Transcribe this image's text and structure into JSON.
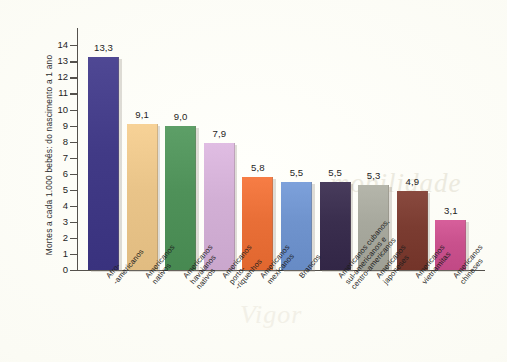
{
  "figure": {
    "background_color": "#fdfdf8",
    "watermark_text": "mobilidade",
    "watermark_text_2": "Vigor"
  },
  "chart_data": {
    "type": "bar",
    "title": "",
    "xlabel": "",
    "ylabel": "Mortes a cada 1.000 bebês: do nascimento a 1 ano",
    "ylim": [
      0,
      14
    ],
    "ytick_labels": [
      "0",
      "1",
      "2",
      "3",
      "4",
      "5",
      "6",
      "7",
      "8",
      "9",
      "10",
      "11",
      "12",
      "13",
      "14"
    ],
    "grid": false,
    "legend": "none",
    "value_label_format": "comma-decimal",
    "categories": [
      "Afro-\n-americanos",
      "Americanos\nnativos",
      "Americanos\nhavaianos\nnativos",
      "Americanos\nporto-\n-riquenhos",
      "Americanos\nmexicanos",
      "Brancos",
      "Americanos cubanos,\nsul-americanos e\ncentro-americanos",
      "Americanos\njaponeses",
      "Americanos\nvietnamitas",
      "Americanos\nchineses"
    ],
    "values": [
      13.3,
      9.1,
      9.0,
      7.9,
      5.8,
      5.5,
      5.5,
      5.3,
      4.9,
      3.1
    ],
    "value_labels": [
      "13,3",
      "9,1",
      "9,0",
      "7,9",
      "5,8",
      "5,5",
      "5,5",
      "5,3",
      "4,9",
      "3,1"
    ],
    "colors": [
      "#413a86",
      "#e9c489",
      "#4f9159",
      "#d2afd5",
      "#e96f37",
      "#6f93cd",
      "#3a2e4e",
      "#a7a89d",
      "#7b3c31",
      "#c9518d"
    ],
    "colors_top": [
      "#4c45a0",
      "#f0d3a4",
      "#63a56c",
      "#ddc4e1",
      "#f0approx",
      "#86a5da",
      "#4a3c63",
      "#b8b9af",
      "#8f4a3d",
      "#d9689f"
    ]
  }
}
